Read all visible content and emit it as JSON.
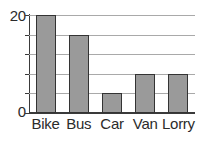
{
  "chart_data": {
    "type": "bar",
    "title": "",
    "xlabel": "",
    "ylabel": "",
    "categories": [
      "Bike",
      "Bus",
      "Car",
      "Van",
      "Lorry"
    ],
    "values": [
      20,
      16,
      4,
      8,
      8
    ],
    "ylim": [
      0,
      20
    ],
    "ytick_values": [
      0,
      4,
      8,
      12,
      16,
      20
    ],
    "ytick_labels_shown": [
      "0",
      "20"
    ],
    "grid": true,
    "grid_axis": "y",
    "legend": false,
    "bar_color": "#9a9a9a",
    "bar_edge_color": "#333333",
    "gridline_color": "#a9a9a9",
    "axis_color": "#3a3a3a",
    "background_color": "#ffffff"
  },
  "axis": {
    "y_top_label": "20",
    "y_bottom_label": "0"
  }
}
